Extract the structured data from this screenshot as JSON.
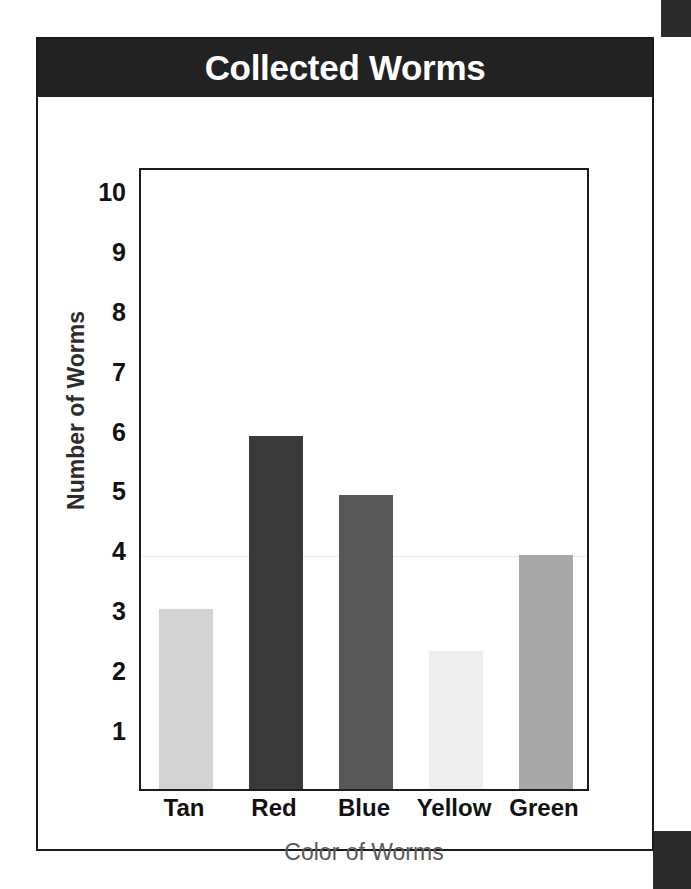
{
  "page": {
    "background_color": "#ffffff",
    "frame_color": "#1a1a1a",
    "edge_block_color": "#2b2b2b"
  },
  "title_banner": {
    "text": "Collected Worms",
    "background_color": "#222222",
    "text_color": "#ffffff"
  },
  "chart_data": {
    "type": "bar",
    "title": "Collected Worms",
    "xlabel": "Color of Worms",
    "ylabel": "Number of Worms",
    "categories": [
      "Tan",
      "Red",
      "Blue",
      "Yellow",
      "Green"
    ],
    "values": [
      3,
      5.9,
      4.9,
      2.3,
      3.9
    ],
    "bar_colors": [
      "#d3d3d3",
      "#3a3a3a",
      "#585858",
      "#ededed",
      "#a8a8a8"
    ],
    "ylim": [
      0,
      10.4
    ],
    "yticks": [
      1,
      2,
      3,
      4,
      5,
      6,
      7,
      8,
      9,
      10
    ],
    "ytick_labels": [
      "1",
      "2",
      "3",
      "4",
      "5",
      "6",
      "7",
      "8",
      "9",
      "10"
    ],
    "grid": false,
    "legend": false
  }
}
